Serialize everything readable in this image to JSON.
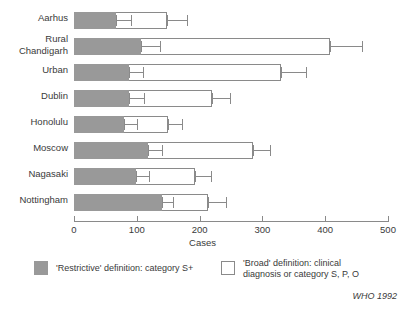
{
  "chart_data": {
    "type": "bar",
    "orientation": "horizontal",
    "stacked": true,
    "title": "",
    "xlabel": "Cases",
    "ylabel": "",
    "xlim": [
      0,
      500
    ],
    "xticks": [
      0,
      100,
      200,
      300,
      400,
      500
    ],
    "grid": false,
    "legend_position": "bottom",
    "categories": [
      "Aarhus",
      "Rural Chandigarh",
      "Urban",
      "Dublin",
      "Honolulu",
      "Moscow",
      "Nagasaki",
      "Nottingham"
    ],
    "category_labels_display": [
      [
        "Aarhus"
      ],
      [
        "Rural",
        "Chandigarh"
      ],
      [
        "Urban"
      ],
      [
        "Dublin"
      ],
      [
        "Honolulu"
      ],
      [
        "Moscow"
      ],
      [
        "Nagasaki"
      ],
      [
        "Nottingham"
      ]
    ],
    "series": [
      {
        "name": "'Restrictive' definition: category S+",
        "color": "#999999",
        "values": [
          67,
          107,
          88,
          88,
          80,
          118,
          98,
          140
        ],
        "error_high": [
          90,
          137,
          110,
          112,
          100,
          140,
          120,
          158
        ]
      },
      {
        "name": "'Broad' definition: clinical diagnosis or category S, P, O",
        "color": "#ffffff",
        "values": [
          148,
          408,
          330,
          220,
          150,
          285,
          192,
          213
        ],
        "error_high": [
          180,
          458,
          370,
          248,
          172,
          312,
          218,
          242
        ]
      }
    ],
    "source": "WHO 1992"
  },
  "axis": {
    "x_title": "Cases",
    "tick_labels": [
      "0",
      "100",
      "200",
      "300",
      "400",
      "500"
    ]
  },
  "legend": {
    "restrictive": {
      "swatch": "grey-filled-square",
      "lines": [
        "'Restrictive' definition: category S+"
      ]
    },
    "broad": {
      "swatch": "white-outlined-square",
      "lines": [
        "'Broad' definition: clinical",
        "diagnosis or category S, P, O"
      ]
    }
  },
  "source_note": "WHO 1992",
  "colors": {
    "restrictive_fill": "#999999",
    "broad_fill": "#ffffff",
    "stroke": "#8a8a8a",
    "text": "#3a3a3a"
  }
}
